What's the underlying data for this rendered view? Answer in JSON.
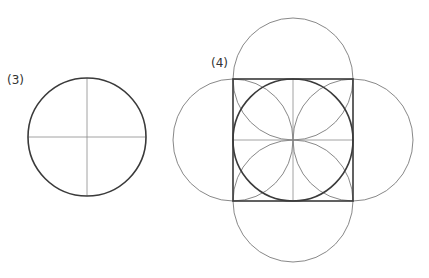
{
  "figures": [
    {
      "label": "(3)",
      "description": "circle with horizontal and vertical diameters",
      "circle": {
        "cx": 87,
        "cy": 137,
        "r": 59
      }
    },
    {
      "label": "(4)",
      "description": "square with inscribed circle, quarter division lines, four inner semicircles and four outer semicircles",
      "square": {
        "x": 233,
        "y": 79,
        "w": 120,
        "h": 122
      },
      "inscribed_circle": {
        "cx": 293,
        "cy": 140,
        "r": 60
      }
    }
  ],
  "colors": {
    "thick_stroke": "#3a3a3a",
    "thin_stroke": "#6a6a6a",
    "guide_stroke": "#8a8a8a"
  }
}
